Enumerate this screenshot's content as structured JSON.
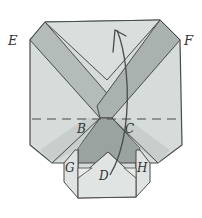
{
  "diagram": {
    "type": "origami-fold-diagram",
    "labels": {
      "E": "E",
      "F": "F",
      "B": "B",
      "C": "C",
      "G": "G",
      "D": "D",
      "H": "H"
    },
    "colors": {
      "background": "#ffffff",
      "paper_light": "#d6dcda",
      "paper_mid": "#b9c1be",
      "paper_dark": "#959e9b",
      "paper_lighter": "#e2e7e5",
      "line": "#4a4a4a"
    },
    "annotations": {
      "fold_line": "dashed horizontal line through B and C",
      "arrow": "curved arrow pointing upward at top center"
    }
  }
}
